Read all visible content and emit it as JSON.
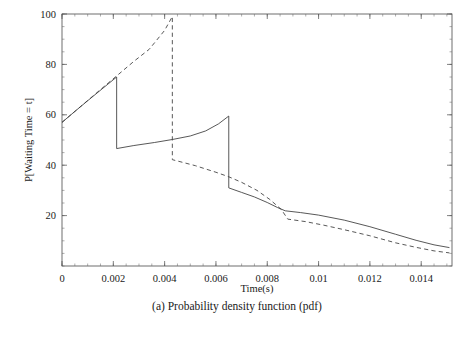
{
  "figure": {
    "caption": "(a) Probability density function (pdf)"
  },
  "chart_data": {
    "type": "line",
    "title": "",
    "xlabel": "Time(s)",
    "ylabel": "P[Waiting Time = t]",
    "xlim": [
      0,
      0.0152
    ],
    "ylim": [
      0,
      100
    ],
    "grid": false,
    "legend": "none",
    "x_ticks": [
      0,
      0.002,
      0.004,
      0.006,
      0.008,
      0.01,
      0.012,
      0.014
    ],
    "x_tick_labels": [
      "0",
      "0.002",
      "0.004",
      "0.006",
      "0.008",
      "0.01",
      "0.012",
      "0.014"
    ],
    "y_ticks": [
      20,
      40,
      60,
      80,
      100
    ],
    "y_tick_labels": [
      "20",
      "40",
      "60",
      "80",
      "100"
    ],
    "x_minor_step": 0.0005,
    "y_minor_step": 5,
    "series": [
      {
        "name": "solid-curve",
        "style": "solid",
        "color": "#3a3a3a",
        "points": [
          [
            0.0,
            57.0
          ],
          [
            0.00052,
            61.5
          ],
          [
            0.00105,
            66.0
          ],
          [
            0.0016,
            70.6
          ],
          [
            0.00213,
            75.0
          ],
          [
            0.00213,
            46.6
          ],
          [
            0.0028,
            47.8
          ],
          [
            0.0036,
            49.0
          ],
          [
            0.0043,
            50.2
          ],
          [
            0.005,
            51.6
          ],
          [
            0.0056,
            53.6
          ],
          [
            0.0061,
            56.4
          ],
          [
            0.0065,
            59.5
          ],
          [
            0.0065,
            31.0
          ],
          [
            0.007,
            29.2
          ],
          [
            0.0075,
            27.4
          ],
          [
            0.008,
            25.2
          ],
          [
            0.0084,
            23.2
          ],
          [
            0.0087,
            21.9
          ],
          [
            0.0093,
            21.2
          ],
          [
            0.01,
            20.2
          ],
          [
            0.011,
            18.2
          ],
          [
            0.012,
            15.6
          ],
          [
            0.013,
            12.6
          ],
          [
            0.0138,
            10.2
          ],
          [
            0.0145,
            8.4
          ],
          [
            0.0151,
            7.3
          ]
        ]
      },
      {
        "name": "dashed-curve",
        "style": "dashed",
        "color": "#3a3a3a",
        "points": [
          [
            0.0,
            57.0
          ],
          [
            0.0006,
            62.2
          ],
          [
            0.0012,
            67.4
          ],
          [
            0.0018,
            72.6
          ],
          [
            0.00215,
            75.6
          ],
          [
            0.0028,
            81.2
          ],
          [
            0.0034,
            86.0
          ],
          [
            0.004,
            93.5
          ],
          [
            0.0043,
            99.0
          ],
          [
            0.0043,
            42.2
          ],
          [
            0.0052,
            39.8
          ],
          [
            0.006,
            37.2
          ],
          [
            0.0065,
            35.4
          ],
          [
            0.007,
            33.2
          ],
          [
            0.0076,
            30.0
          ],
          [
            0.0081,
            26.4
          ],
          [
            0.00855,
            22.4
          ],
          [
            0.0088,
            18.6
          ],
          [
            0.0095,
            17.6
          ],
          [
            0.0102,
            16.2
          ],
          [
            0.011,
            14.4
          ],
          [
            0.012,
            12.0
          ],
          [
            0.013,
            9.2
          ],
          [
            0.0138,
            7.4
          ],
          [
            0.0145,
            6.0
          ],
          [
            0.0151,
            5.2
          ]
        ]
      }
    ]
  }
}
